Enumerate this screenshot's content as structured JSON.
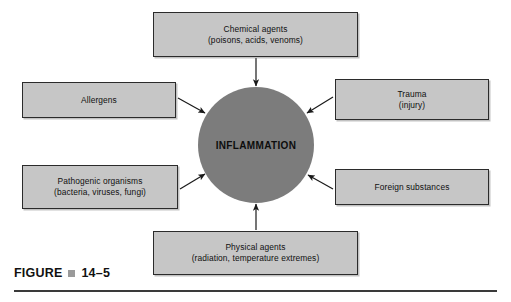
{
  "figure": {
    "label": "FIGURE",
    "bullet_icon": "square-bullet-icon",
    "number": "14–5"
  },
  "center": {
    "label": "INFLAMMATION",
    "fill_color": "#7c7c7c"
  },
  "theme": {
    "box_fill": "#c6c6c6",
    "box_border": "#2b2b2b",
    "arrow_color": "#1a1a1a",
    "page_background": "#ffffff",
    "bullet_color": "#9a9a9a",
    "rule_color": "#3a3a3a"
  },
  "nodes": [
    {
      "id": "chemical-agents",
      "line1": "Chemical agents",
      "line2": "(poisons, acids, venoms)",
      "position": "top"
    },
    {
      "id": "allergens",
      "line1": "Allergens",
      "line2": "",
      "position": "upper-left"
    },
    {
      "id": "trauma",
      "line1": "Trauma",
      "line2": "(injury)",
      "position": "upper-right"
    },
    {
      "id": "pathogenic-organisms",
      "line1": "Pathogenic organisms",
      "line2": "(bacteria, viruses, fungi)",
      "position": "lower-left"
    },
    {
      "id": "foreign-substances",
      "line1": "Foreign substances",
      "line2": "",
      "position": "lower-right"
    },
    {
      "id": "physical-agents",
      "line1": "Physical agents",
      "line2": "(radiation, temperature extremes)",
      "position": "bottom"
    }
  ],
  "arrows": [
    {
      "from": "chemical-agents",
      "to": "center",
      "direction": "down"
    },
    {
      "from": "allergens",
      "to": "center",
      "direction": "down-right"
    },
    {
      "from": "trauma",
      "to": "center",
      "direction": "down-left"
    },
    {
      "from": "pathogenic-organisms",
      "to": "center",
      "direction": "up-right"
    },
    {
      "from": "foreign-substances",
      "to": "center",
      "direction": "up-left"
    },
    {
      "from": "physical-agents",
      "to": "center",
      "direction": "up"
    }
  ]
}
